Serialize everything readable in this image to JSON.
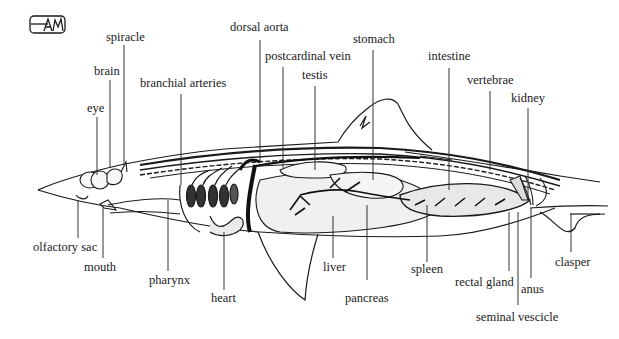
{
  "figure": {
    "logo_text": "AM"
  },
  "labels": {
    "spiracle": "spiracle",
    "brain": "brain",
    "eye": "eye",
    "branchial_arteries": "branchial arteries",
    "dorsal_aorta": "dorsal aorta",
    "postcardinal_vein": "postcardinal vein",
    "testis": "testis",
    "stomach": "stomach",
    "intestine": "intestine",
    "vertebrae": "vertebrae",
    "kidney": "kidney",
    "olfactory_sac": "olfactory sac",
    "mouth": "mouth",
    "pharynx": "pharynx",
    "heart": "heart",
    "liver": "liver",
    "pancreas": "pancreas",
    "spleen": "spleen",
    "rectal_gland": "rectal gland",
    "anus": "anus",
    "seminal_vescicle": "seminal vescicle",
    "clasper": "clasper"
  },
  "colors": {
    "ink": "#1a1a1a",
    "leader": "#333333",
    "background": "#ffffff",
    "organ_fill": "#f2f2f2"
  }
}
